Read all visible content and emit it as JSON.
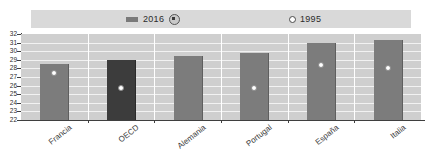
{
  "legend": {
    "series_2016": {
      "label": "2016",
      "marker": "bar-swatch-icon",
      "note_icon": "info-circle-icon"
    },
    "series_1995": {
      "label": "1995",
      "marker": "hollow-circle-icon"
    }
  },
  "axis": {
    "y_ticks": [
      "32",
      "31",
      "30",
      "29",
      "28",
      "27",
      "26",
      "25",
      "24",
      "23",
      "22"
    ]
  },
  "colors": {
    "bar_2016": "#7c7c7c",
    "bar_2016_highlight": "#3c3c3c",
    "marker_1995": "#ffffff",
    "plot_background": "#cfcfcf",
    "gridline": "#f2f2f2",
    "legend_background": "#d9d9d9"
  },
  "chart_data": {
    "type": "bar",
    "title": "",
    "xlabel": "",
    "ylabel": "",
    "ylim": [
      22,
      32
    ],
    "ytick_step": 1,
    "grid": true,
    "legend_position": "top",
    "categories": [
      "Francia",
      "OECD",
      "Alemania",
      "Portugal",
      "España",
      "Italia"
    ],
    "series": [
      {
        "name": "2016",
        "type": "bar",
        "values": [
          28.5,
          29.0,
          29.5,
          29.8,
          31.0,
          31.3
        ],
        "highlighted_category": "OECD"
      },
      {
        "name": "1995",
        "type": "scatter",
        "values": [
          27.7,
          26.0,
          null,
          25.9,
          28.6,
          28.3
        ]
      }
    ]
  }
}
